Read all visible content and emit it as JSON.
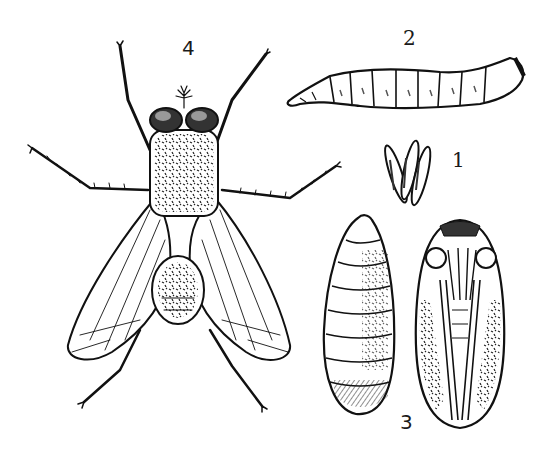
{
  "illustration": {
    "subject": "Housefly life cycle",
    "style": "black-and-white engraving",
    "colors": {
      "ink": "#111111",
      "paper": "#ffffff",
      "shade": "#555555"
    },
    "figures": [
      {
        "number": "1",
        "name": "eggs"
      },
      {
        "number": "2",
        "name": "larva"
      },
      {
        "number": "3",
        "name": "pupae"
      },
      {
        "number": "4",
        "name": "adult fly"
      }
    ]
  }
}
